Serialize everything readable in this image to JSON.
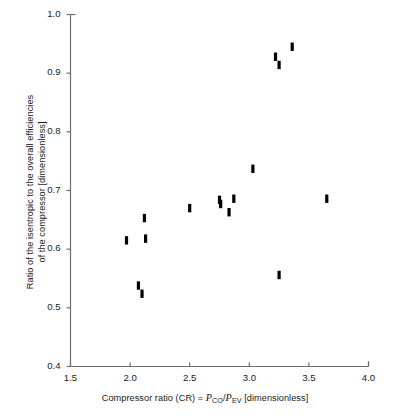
{
  "chart_data": {
    "type": "scatter",
    "title": "",
    "xlabel": "Compressor ratio (CR) = P_CO/P_EV [dimensionless]",
    "ylabel": "Ratio of the isentropic to the overall efficiencies of the compressor [dimensionless]",
    "xlim": [
      1.5,
      4.0
    ],
    "ylim": [
      0.4,
      1.0
    ],
    "xticks": [
      "1.5",
      "2.0",
      "2.5",
      "3.0",
      "3.5",
      "4.0"
    ],
    "xtick_values": [
      1.5,
      2.0,
      2.5,
      3.0,
      3.5,
      4.0
    ],
    "yticks": [
      "0.4",
      "0.5",
      "0.6",
      "0.7",
      "0.8",
      "0.9",
      "1.0"
    ],
    "ytick_values": [
      0.4,
      0.5,
      0.6,
      0.7,
      0.8,
      0.9,
      1.0
    ],
    "grid": false,
    "legend": null,
    "marker": "vertical-bar",
    "marker_color": "#000000",
    "series": [
      {
        "name": "compressor efficiency ratio",
        "points": [
          {
            "x": 1.97,
            "y": 0.615
          },
          {
            "x": 2.07,
            "y": 0.538
          },
          {
            "x": 2.1,
            "y": 0.524
          },
          {
            "x": 2.12,
            "y": 0.653
          },
          {
            "x": 2.13,
            "y": 0.618
          },
          {
            "x": 2.5,
            "y": 0.67
          },
          {
            "x": 2.75,
            "y": 0.684
          },
          {
            "x": 2.76,
            "y": 0.677
          },
          {
            "x": 2.83,
            "y": 0.663
          },
          {
            "x": 2.87,
            "y": 0.686
          },
          {
            "x": 3.03,
            "y": 0.737
          },
          {
            "x": 3.22,
            "y": 0.928
          },
          {
            "x": 3.25,
            "y": 0.914
          },
          {
            "x": 3.25,
            "y": 0.556
          },
          {
            "x": 3.36,
            "y": 0.945
          },
          {
            "x": 3.65,
            "y": 0.686
          }
        ]
      }
    ]
  },
  "axis": {
    "ylabel_line1": "Ratio of the isentropic to the overall efficiencies",
    "ylabel_line2": "of the compressor [dimensionless]",
    "xlabel_prefix": "Compressor ratio (CR) = ",
    "xlabel_p1": "P",
    "xlabel_sub1": "CO",
    "xlabel_slash": "/",
    "xlabel_p2": "P",
    "xlabel_sub2": "EV",
    "xlabel_suffix": " [dimensionless]"
  },
  "colors": {
    "axis": "#6f6f6f",
    "marker": "#0d0d0d",
    "text": "#1a1a1a",
    "background": "#ffffff"
  }
}
